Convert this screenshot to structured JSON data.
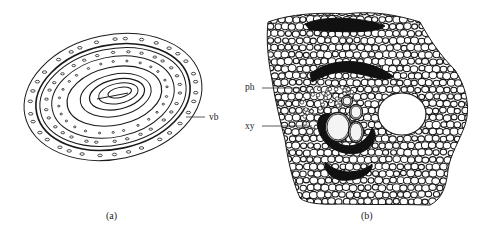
{
  "figure": {
    "panels": [
      {
        "id": "a",
        "caption": "(a)",
        "description": "Transverse section outline showing concentric rings with scattered vascular bundles",
        "labels": [
          {
            "id": "vb",
            "text": "vb",
            "meaning": "vascular bundle"
          }
        ]
      },
      {
        "id": "b",
        "caption": "(b)",
        "description": "Detailed cellular view of a vascular bundle within parenchyma, with a large air space",
        "labels": [
          {
            "id": "ph",
            "text": "ph",
            "meaning": "phloem"
          },
          {
            "id": "xy",
            "text": "xy",
            "meaning": "xylem"
          }
        ]
      }
    ],
    "colors": {
      "ink": "#1a1a1a",
      "background": "#ffffff",
      "fill_dark": "#111111"
    }
  }
}
